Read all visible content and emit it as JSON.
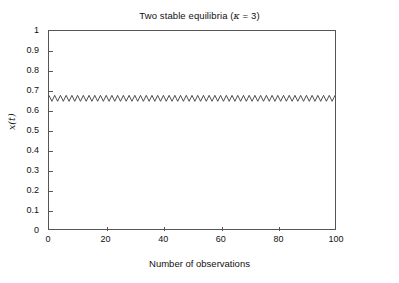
{
  "chart_data": {
    "type": "line",
    "title": "Two stable equilibria (κ = 3)",
    "title_prefix": "Two stable equilibria (",
    "title_symbol": "κ",
    "title_suffix": " = 3)",
    "xlabel": "Number of observations",
    "ylabel": "x(t)",
    "xlim": [
      0,
      100
    ],
    "ylim": [
      0,
      1
    ],
    "grid": false,
    "legend": null,
    "line_color": "#3a3a3a",
    "frame_color": "#555555",
    "background_color": "#ffffff",
    "xticks": [
      0,
      20,
      40,
      60,
      80,
      100
    ],
    "xtick_labels": [
      "0",
      "20",
      "40",
      "60",
      "80",
      "100"
    ],
    "yticks": [
      0,
      0.1,
      0.2,
      0.3,
      0.4,
      0.5,
      0.6,
      0.7,
      0.8,
      0.9,
      1
    ],
    "ytick_labels": [
      "0",
      "0.1",
      "0.2",
      "0.3",
      "0.4",
      "0.5",
      "0.6",
      "0.7",
      "0.8",
      "0.9",
      "1"
    ],
    "series": [
      {
        "name": "x(t)",
        "description": "Period-2 oscillation between two stable equilibria",
        "equilibrium_high": 0.675,
        "equilibrium_low": 0.645,
        "mean": 0.66,
        "amplitude": 0.015,
        "period": 2,
        "x": [
          0,
          1,
          2,
          3,
          4,
          5,
          6,
          7,
          8,
          9,
          10,
          11,
          12,
          13,
          14,
          15,
          16,
          17,
          18,
          19,
          20,
          21,
          22,
          23,
          24,
          25,
          26,
          27,
          28,
          29,
          30,
          31,
          32,
          33,
          34,
          35,
          36,
          37,
          38,
          39,
          40,
          41,
          42,
          43,
          44,
          45,
          46,
          47,
          48,
          49,
          50,
          51,
          52,
          53,
          54,
          55,
          56,
          57,
          58,
          59,
          60,
          61,
          62,
          63,
          64,
          65,
          66,
          67,
          68,
          69,
          70,
          71,
          72,
          73,
          74,
          75,
          76,
          77,
          78,
          79,
          80,
          81,
          82,
          83,
          84,
          85,
          86,
          87,
          88,
          89,
          90,
          91,
          92,
          93,
          94,
          95,
          96,
          97,
          98,
          99,
          100
        ],
        "y": [
          0.675,
          0.645,
          0.675,
          0.645,
          0.675,
          0.645,
          0.675,
          0.645,
          0.675,
          0.645,
          0.675,
          0.645,
          0.675,
          0.645,
          0.675,
          0.645,
          0.675,
          0.645,
          0.675,
          0.645,
          0.675,
          0.645,
          0.675,
          0.645,
          0.675,
          0.645,
          0.675,
          0.645,
          0.675,
          0.645,
          0.675,
          0.645,
          0.675,
          0.645,
          0.675,
          0.645,
          0.675,
          0.645,
          0.675,
          0.645,
          0.675,
          0.645,
          0.675,
          0.645,
          0.675,
          0.645,
          0.675,
          0.645,
          0.675,
          0.645,
          0.675,
          0.645,
          0.675,
          0.645,
          0.675,
          0.645,
          0.675,
          0.645,
          0.675,
          0.645,
          0.675,
          0.645,
          0.675,
          0.645,
          0.675,
          0.645,
          0.675,
          0.645,
          0.675,
          0.645,
          0.675,
          0.645,
          0.675,
          0.645,
          0.675,
          0.645,
          0.675,
          0.645,
          0.675,
          0.645,
          0.675,
          0.645,
          0.675,
          0.645,
          0.675,
          0.645,
          0.675,
          0.645,
          0.675,
          0.645,
          0.675,
          0.645,
          0.675,
          0.645,
          0.675,
          0.645,
          0.675,
          0.645,
          0.675,
          0.645,
          0.675
        ]
      }
    ]
  }
}
